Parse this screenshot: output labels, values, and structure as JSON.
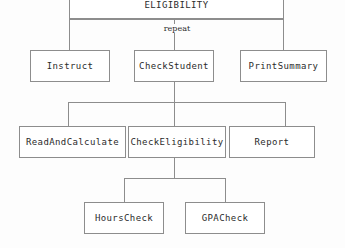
{
  "diagram": {
    "type": "structure-chart",
    "title_node": "ELIGIBILITY",
    "levels": 4,
    "nodes": {
      "root": {
        "label": "ELIGIBILITY"
      },
      "instruct": {
        "label": "Instruct"
      },
      "check_student": {
        "label": "CheckStudent"
      },
      "print_summary": {
        "label": "PrintSummary"
      },
      "read_and_calculate": {
        "label": "ReadAndCalculate"
      },
      "check_eligibility": {
        "label": "CheckEligibility"
      },
      "report": {
        "label": "Report"
      },
      "hours_check": {
        "label": "HoursCheck"
      },
      "gpa_check": {
        "label": "GPACheck"
      }
    },
    "edge_labels": {
      "repeat": "repeat"
    },
    "colors": {
      "box_border": "#8d8d8d",
      "connector": "#8d8d8d",
      "text": "#2b2b2b",
      "background": "#fdfdfd"
    }
  }
}
